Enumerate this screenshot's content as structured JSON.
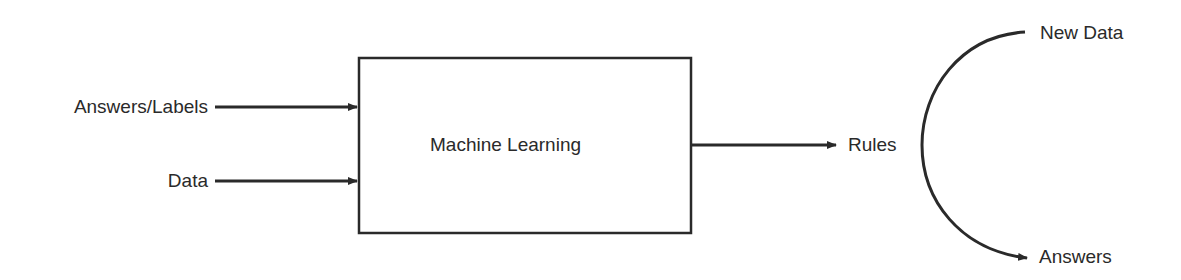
{
  "diagram": {
    "inputs": [
      {
        "label": "Answers/Labels"
      },
      {
        "label": "Data"
      }
    ],
    "process": {
      "label": "Machine Learning"
    },
    "output": {
      "label": "Rules"
    },
    "application": {
      "input_label": "New Data",
      "output_label": "Answers"
    },
    "colors": {
      "stroke": "#2a2a2a",
      "text": "#2a2a2a",
      "background": "#ffffff"
    }
  }
}
